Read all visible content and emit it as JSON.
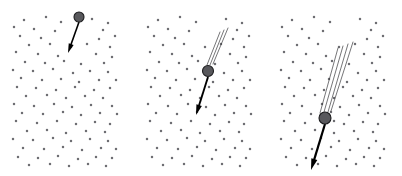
{
  "figure": {
    "background_color": "#ffffff",
    "width": 402,
    "height": 176,
    "colors": {
      "dot": "#6e6e73",
      "particle_fill": "#58585c",
      "particle_stroke": "#1c1c1e",
      "trail": "#3a3a3c",
      "arrow": "#000000"
    }
  },
  "panels": [
    {
      "name": "panel-1",
      "label": "",
      "origin_x": 8,
      "origin_y": 10,
      "width": 118,
      "height": 160,
      "particle": {
        "cx": 79,
        "cy": 17,
        "r": 5.0
      },
      "arrow": {
        "x1": 79,
        "y1": 22,
        "x2": 68,
        "y2": 53,
        "width": 1.6,
        "head_size": 5.0
      },
      "trails": [],
      "dots": [
        [
          24,
          20
        ],
        [
          46,
          17
        ],
        [
          61,
          22
        ],
        [
          92,
          19
        ],
        [
          108,
          23
        ],
        [
          14,
          27
        ],
        [
          34,
          29
        ],
        [
          55,
          31
        ],
        [
          103,
          30
        ],
        [
          20,
          36
        ],
        [
          41,
          38
        ],
        [
          99,
          39
        ],
        [
          115,
          36
        ],
        [
          29,
          45
        ],
        [
          50,
          44
        ],
        [
          71,
          47
        ],
        [
          87,
          44
        ],
        [
          110,
          47
        ],
        [
          16,
          52
        ],
        [
          38,
          54
        ],
        [
          58,
          56
        ],
        [
          96,
          54
        ],
        [
          112,
          57
        ],
        [
          25,
          62
        ],
        [
          45,
          63
        ],
        [
          64,
          61
        ],
        [
          81,
          64
        ],
        [
          104,
          63
        ],
        [
          13,
          70
        ],
        [
          33,
          71
        ],
        [
          53,
          69
        ],
        [
          73,
          73
        ],
        [
          90,
          71
        ],
        [
          108,
          72
        ],
        [
          21,
          78
        ],
        [
          42,
          80
        ],
        [
          61,
          79
        ],
        [
          79,
          82
        ],
        [
          99,
          80
        ],
        [
          116,
          80
        ],
        [
          17,
          87
        ],
        [
          36,
          88
        ],
        [
          56,
          90
        ],
        [
          75,
          87
        ],
        [
          94,
          90
        ],
        [
          110,
          88
        ],
        [
          26,
          96
        ],
        [
          47,
          95
        ],
        [
          66,
          98
        ],
        [
          85,
          96
        ],
        [
          103,
          98
        ],
        [
          14,
          104
        ],
        [
          34,
          106
        ],
        [
          54,
          104
        ],
        [
          72,
          107
        ],
        [
          91,
          105
        ],
        [
          112,
          106
        ],
        [
          22,
          113
        ],
        [
          43,
          114
        ],
        [
          63,
          112
        ],
        [
          81,
          115
        ],
        [
          100,
          113
        ],
        [
          117,
          114
        ],
        [
          16,
          121
        ],
        [
          37,
          123
        ],
        [
          57,
          121
        ],
        [
          76,
          124
        ],
        [
          95,
          122
        ],
        [
          110,
          124
        ],
        [
          27,
          131
        ],
        [
          47,
          130
        ],
        [
          66,
          133
        ],
        [
          86,
          131
        ],
        [
          105,
          132
        ],
        [
          13,
          139
        ],
        [
          33,
          140
        ],
        [
          53,
          138
        ],
        [
          71,
          141
        ],
        [
          90,
          139
        ],
        [
          108,
          141
        ],
        [
          23,
          148
        ],
        [
          44,
          149
        ],
        [
          63,
          147
        ],
        [
          82,
          150
        ],
        [
          101,
          148
        ],
        [
          116,
          149
        ],
        [
          18,
          157
        ],
        [
          38,
          158
        ],
        [
          58,
          156
        ],
        [
          78,
          159
        ],
        [
          96,
          157
        ],
        [
          112,
          158
        ],
        [
          29,
          165
        ],
        [
          50,
          164
        ],
        [
          69,
          166
        ],
        [
          88,
          164
        ],
        [
          106,
          166
        ]
      ]
    },
    {
      "name": "panel-2",
      "label": "",
      "origin_x": 142,
      "origin_y": 10,
      "width": 118,
      "height": 160,
      "particle": {
        "cx": 208,
        "cy": 71,
        "r": 5.5
      },
      "arrow": {
        "x1": 208,
        "y1": 77,
        "x2": 196,
        "y2": 115,
        "width": 1.9,
        "head_size": 5.5
      },
      "trails": [
        {
          "x1": 213,
          "y1": 64,
          "x2": 228,
          "y2": 28
        },
        {
          "x1": 210,
          "y1": 65,
          "x2": 224,
          "y2": 30
        },
        {
          "x1": 207,
          "y1": 65,
          "x2": 220,
          "y2": 32
        }
      ],
      "dots": [
        [
          158,
          20
        ],
        [
          180,
          17
        ],
        [
          196,
          22
        ],
        [
          226,
          19
        ],
        [
          242,
          23
        ],
        [
          148,
          27
        ],
        [
          168,
          29
        ],
        [
          189,
          31
        ],
        [
          237,
          30
        ],
        [
          154,
          36
        ],
        [
          175,
          38
        ],
        [
          233,
          39
        ],
        [
          249,
          36
        ],
        [
          163,
          45
        ],
        [
          184,
          44
        ],
        [
          205,
          47
        ],
        [
          221,
          44
        ],
        [
          244,
          47
        ],
        [
          150,
          52
        ],
        [
          172,
          54
        ],
        [
          192,
          56
        ],
        [
          230,
          54
        ],
        [
          246,
          57
        ],
        [
          159,
          62
        ],
        [
          179,
          63
        ],
        [
          198,
          61
        ],
        [
          215,
          64
        ],
        [
          238,
          63
        ],
        [
          147,
          70
        ],
        [
          167,
          71
        ],
        [
          187,
          69
        ],
        [
          224,
          73
        ],
        [
          242,
          71
        ],
        [
          155,
          78
        ],
        [
          176,
          80
        ],
        [
          195,
          79
        ],
        [
          213,
          82
        ],
        [
          233,
          80
        ],
        [
          250,
          80
        ],
        [
          151,
          87
        ],
        [
          170,
          88
        ],
        [
          190,
          90
        ],
        [
          209,
          87
        ],
        [
          228,
          90
        ],
        [
          244,
          88
        ],
        [
          160,
          96
        ],
        [
          181,
          95
        ],
        [
          200,
          98
        ],
        [
          219,
          96
        ],
        [
          237,
          98
        ],
        [
          148,
          104
        ],
        [
          168,
          106
        ],
        [
          188,
          104
        ],
        [
          206,
          107
        ],
        [
          225,
          105
        ],
        [
          246,
          106
        ],
        [
          156,
          113
        ],
        [
          177,
          114
        ],
        [
          197,
          112
        ],
        [
          215,
          115
        ],
        [
          234,
          113
        ],
        [
          251,
          114
        ],
        [
          150,
          121
        ],
        [
          171,
          123
        ],
        [
          191,
          121
        ],
        [
          210,
          124
        ],
        [
          229,
          122
        ],
        [
          244,
          124
        ],
        [
          161,
          131
        ],
        [
          181,
          130
        ],
        [
          200,
          133
        ],
        [
          220,
          131
        ],
        [
          239,
          132
        ],
        [
          147,
          139
        ],
        [
          167,
          140
        ],
        [
          187,
          138
        ],
        [
          205,
          141
        ],
        [
          224,
          139
        ],
        [
          242,
          141
        ],
        [
          157,
          148
        ],
        [
          178,
          149
        ],
        [
          197,
          147
        ],
        [
          216,
          150
        ],
        [
          235,
          148
        ],
        [
          250,
          149
        ],
        [
          152,
          157
        ],
        [
          172,
          158
        ],
        [
          192,
          156
        ],
        [
          212,
          159
        ],
        [
          230,
          157
        ],
        [
          246,
          158
        ],
        [
          163,
          165
        ],
        [
          184,
          164
        ],
        [
          203,
          166
        ],
        [
          222,
          164
        ],
        [
          240,
          166
        ]
      ]
    },
    {
      "name": "panel-3",
      "label": "",
      "origin_x": 276,
      "origin_y": 10,
      "width": 118,
      "height": 160,
      "particle": {
        "cx": 325,
        "cy": 118,
        "r": 6.0
      },
      "arrow": {
        "x1": 325,
        "y1": 124,
        "x2": 311,
        "y2": 170,
        "width": 2.2,
        "head_size": 6.0
      },
      "trails": [
        {
          "x1": 331,
          "y1": 111,
          "x2": 353,
          "y2": 42
        },
        {
          "x1": 328,
          "y1": 112,
          "x2": 348,
          "y2": 44
        },
        {
          "x1": 324,
          "y1": 112,
          "x2": 343,
          "y2": 46
        },
        {
          "x1": 320,
          "y1": 113,
          "x2": 338,
          "y2": 48
        }
      ],
      "dots": [
        [
          292,
          20
        ],
        [
          314,
          17
        ],
        [
          330,
          22
        ],
        [
          360,
          19
        ],
        [
          376,
          23
        ],
        [
          282,
          27
        ],
        [
          302,
          29
        ],
        [
          323,
          31
        ],
        [
          371,
          30
        ],
        [
          288,
          36
        ],
        [
          309,
          38
        ],
        [
          367,
          39
        ],
        [
          383,
          36
        ],
        [
          297,
          45
        ],
        [
          318,
          44
        ],
        [
          339,
          47
        ],
        [
          355,
          44
        ],
        [
          378,
          47
        ],
        [
          284,
          52
        ],
        [
          306,
          54
        ],
        [
          326,
          56
        ],
        [
          364,
          54
        ],
        [
          380,
          57
        ],
        [
          293,
          62
        ],
        [
          313,
          63
        ],
        [
          332,
          61
        ],
        [
          349,
          64
        ],
        [
          372,
          63
        ],
        [
          281,
          70
        ],
        [
          301,
          71
        ],
        [
          321,
          69
        ],
        [
          358,
          73
        ],
        [
          376,
          71
        ],
        [
          289,
          78
        ],
        [
          310,
          80
        ],
        [
          329,
          79
        ],
        [
          347,
          82
        ],
        [
          367,
          80
        ],
        [
          384,
          80
        ],
        [
          285,
          87
        ],
        [
          304,
          88
        ],
        [
          324,
          90
        ],
        [
          343,
          87
        ],
        [
          362,
          90
        ],
        [
          378,
          88
        ],
        [
          294,
          96
        ],
        [
          315,
          95
        ],
        [
          334,
          98
        ],
        [
          353,
          96
        ],
        [
          371,
          98
        ],
        [
          282,
          104
        ],
        [
          302,
          106
        ],
        [
          322,
          104
        ],
        [
          340,
          107
        ],
        [
          359,
          105
        ],
        [
          380,
          106
        ],
        [
          290,
          113
        ],
        [
          311,
          114
        ],
        [
          331,
          112
        ],
        [
          349,
          115
        ],
        [
          368,
          113
        ],
        [
          385,
          114
        ],
        [
          284,
          121
        ],
        [
          305,
          123
        ],
        [
          334,
          121
        ],
        [
          344,
          124
        ],
        [
          363,
          122
        ],
        [
          378,
          124
        ],
        [
          295,
          131
        ],
        [
          315,
          130
        ],
        [
          334,
          133
        ],
        [
          354,
          131
        ],
        [
          373,
          132
        ],
        [
          281,
          139
        ],
        [
          301,
          140
        ],
        [
          321,
          138
        ],
        [
          339,
          141
        ],
        [
          358,
          139
        ],
        [
          376,
          141
        ],
        [
          291,
          148
        ],
        [
          312,
          149
        ],
        [
          331,
          147
        ],
        [
          350,
          150
        ],
        [
          369,
          148
        ],
        [
          384,
          149
        ],
        [
          286,
          157
        ],
        [
          306,
          158
        ],
        [
          326,
          156
        ],
        [
          346,
          159
        ],
        [
          364,
          157
        ],
        [
          380,
          158
        ],
        [
          297,
          165
        ],
        [
          318,
          164
        ],
        [
          337,
          166
        ],
        [
          356,
          164
        ],
        [
          374,
          166
        ]
      ]
    }
  ]
}
